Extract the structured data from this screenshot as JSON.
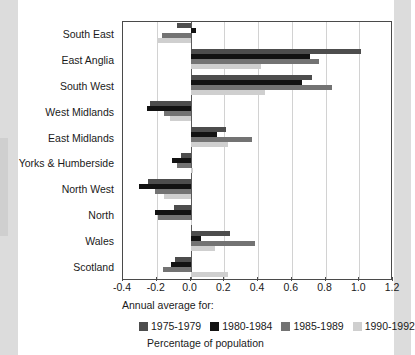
{
  "chart_data": {
    "type": "bar",
    "orientation": "horizontal",
    "title": "",
    "xlabel": "Percentage of population",
    "ylabel": "",
    "xlim": [
      -0.4,
      1.2
    ],
    "xticks": [
      "-0.4",
      "-0.2",
      "0.0",
      "0.2",
      "0.4",
      "0.6",
      "0.8",
      "1.0",
      "1.2"
    ],
    "xtick_values": [
      -0.4,
      -0.2,
      0.0,
      0.2,
      0.4,
      0.6,
      0.8,
      1.0,
      1.2
    ],
    "grid": true,
    "legend_title": "Annual average for:",
    "legend_position": "below-axis",
    "categories": [
      "South East",
      "East Anglia",
      "South West",
      "West Midlands",
      "East Midlands",
      "Yorks & Humberside",
      "North West",
      "North",
      "Wales",
      "Scotland"
    ],
    "series": [
      {
        "name": "1975-1979",
        "color": "#4d4d4d",
        "values": [
          -0.08,
          1.01,
          0.72,
          -0.24,
          0.21,
          -0.055,
          -0.25,
          -0.1,
          0.235,
          -0.09
        ]
      },
      {
        "name": "1980-1984",
        "color": "#121212",
        "values": [
          0.03,
          0.71,
          0.66,
          -0.26,
          0.155,
          -0.11,
          -0.305,
          -0.21,
          0.06,
          -0.115
        ]
      },
      {
        "name": "1985-1989",
        "color": "#737373",
        "values": [
          -0.17,
          0.76,
          0.84,
          -0.155,
          0.365,
          -0.08,
          -0.21,
          -0.195,
          0.38,
          -0.165
        ]
      },
      {
        "name": "1990-1992",
        "color": "#cfcfcf",
        "values": [
          -0.19,
          0.42,
          0.44,
          -0.12,
          0.225,
          0.015,
          -0.155,
          0.01,
          0.145,
          0.22
        ]
      }
    ]
  }
}
